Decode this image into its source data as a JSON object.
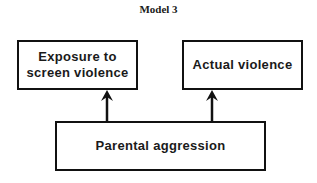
{
  "title": "Model 3",
  "nodes": {
    "exposure": {
      "line1": "Exposure to",
      "line2": "screen violence"
    },
    "actual": {
      "label": "Actual violence"
    },
    "parental": {
      "label": "Parental aggression"
    }
  },
  "edges": [
    {
      "from": "Parental aggression",
      "to": "Exposure to screen violence"
    },
    {
      "from": "Parental aggression",
      "to": "Actual violence"
    }
  ]
}
